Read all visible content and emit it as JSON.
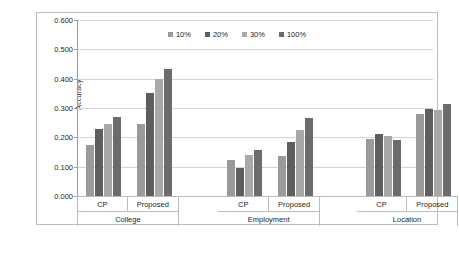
{
  "chart_data": {
    "type": "bar",
    "title": "",
    "subtitle": "",
    "xlabel": "",
    "ylabel": "Accuracy",
    "ylim": [
      0.0,
      0.6
    ],
    "ytick_labels": [
      "0.000",
      "0.100",
      "0.200",
      "0.300",
      "0.400",
      "0.500",
      "0.600"
    ],
    "ytick_values": [
      0.0,
      0.1,
      0.2,
      0.3,
      0.4,
      0.5,
      0.6
    ],
    "grid": "horizontal",
    "legend_position": "top-center",
    "categories": [
      "CP",
      "Proposed",
      "CP",
      "Proposed",
      "CP",
      "Proposed"
    ],
    "group_labels": [
      "College",
      "Employment",
      "Location"
    ],
    "group_spans": [
      2,
      2,
      2
    ],
    "series": [
      {
        "name": "10%",
        "color": "#9a9a9a",
        "values": [
          0.175,
          0.245,
          0.122,
          0.135,
          0.195,
          0.28
        ]
      },
      {
        "name": "20%",
        "color": "#5e5e5e",
        "values": [
          0.23,
          0.35,
          0.095,
          0.185,
          0.21,
          0.298
        ]
      },
      {
        "name": "30%",
        "color": "#a8a8a8",
        "values": [
          0.245,
          0.4,
          0.14,
          0.225,
          0.205,
          0.293
        ]
      },
      {
        "name": "100%",
        "color": "#6b6b6b",
        "values": [
          0.27,
          0.432,
          0.158,
          0.265,
          0.19,
          0.315
        ]
      }
    ],
    "data_by_group": [
      {
        "group": "College",
        "rows": [
          {
            "label": "CP",
            "10%": 0.175,
            "20%": 0.23,
            "30%": 0.245,
            "100%": 0.27
          },
          {
            "label": "Proposed",
            "10%": 0.245,
            "20%": 0.35,
            "30%": 0.4,
            "100%": 0.432
          }
        ]
      },
      {
        "group": "Employment",
        "rows": [
          {
            "label": "CP",
            "10%": 0.122,
            "20%": 0.095,
            "30%": 0.14,
            "100%": 0.158
          },
          {
            "label": "Proposed",
            "10%": 0.135,
            "20%": 0.185,
            "30%": 0.225,
            "100%": 0.265
          }
        ]
      },
      {
        "group": "Location",
        "rows": [
          {
            "label": "CP",
            "10%": 0.195,
            "20%": 0.21,
            "30%": 0.205,
            "100%": 0.19
          },
          {
            "label": "Proposed",
            "10%": 0.28,
            "20%": 0.298,
            "30%": 0.293,
            "100%": 0.315
          }
        ]
      }
    ]
  },
  "legend": {
    "items": [
      {
        "label": "10%",
        "color": "#9a9a9a"
      },
      {
        "label": "20%",
        "color": "#5e5e5e"
      },
      {
        "label": "30%",
        "color": "#a8a8a8"
      },
      {
        "label": "100%",
        "color": "#6b6b6b"
      }
    ]
  },
  "axis": {
    "y_title": "Accuracy"
  },
  "colors": {
    "gridline": "#d4d4d4",
    "axis_line": "#9e9e9e",
    "frame": "#bdbdbd",
    "background": "#ffffff",
    "text": "#262626"
  }
}
